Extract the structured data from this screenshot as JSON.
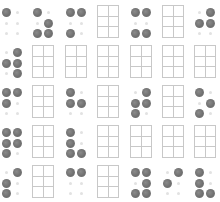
{
  "board": {
    "dot_color": "#777777",
    "grid_color": "#c8c8c8",
    "columns_x": [
      0,
      31,
      64,
      96,
      129,
      161,
      193
    ],
    "rows_y": [
      5,
      45,
      85,
      125,
      165
    ],
    "rows": [
      [
        {
          "type": "braille",
          "dots": [
            1,
            0,
            0,
            0,
            0,
            0
          ]
        },
        {
          "type": "braille",
          "dots": [
            1,
            0,
            0,
            1,
            1,
            1
          ]
        },
        {
          "type": "braille",
          "dots": [
            1,
            1,
            0,
            0,
            1,
            0
          ]
        },
        {
          "type": "grid"
        },
        {
          "type": "braille",
          "dots": [
            1,
            1,
            0,
            0,
            1,
            1
          ]
        },
        {
          "type": "grid"
        },
        {
          "type": "braille",
          "dots": [
            0,
            1,
            1,
            1,
            0,
            0
          ]
        }
      ],
      [
        {
          "type": "braille",
          "dots": [
            0,
            1,
            1,
            1,
            0,
            1
          ]
        },
        {
          "type": "grid"
        },
        {
          "type": "grid"
        },
        {
          "type": "grid"
        },
        {
          "type": "grid"
        },
        {
          "type": "grid"
        },
        {
          "type": "grid"
        }
      ],
      [
        {
          "type": "braille",
          "dots": [
            1,
            1,
            1,
            0,
            0,
            0
          ]
        },
        {
          "type": "grid"
        },
        {
          "type": "braille",
          "dots": [
            1,
            0,
            1,
            1,
            0,
            0
          ]
        },
        {
          "type": "grid"
        },
        {
          "type": "braille",
          "dots": [
            0,
            1,
            1,
            1,
            1,
            0
          ]
        },
        {
          "type": "grid"
        },
        {
          "type": "braille",
          "dots": [
            1,
            0,
            0,
            1,
            1,
            0
          ]
        }
      ],
      [
        {
          "type": "braille",
          "dots": [
            1,
            1,
            1,
            1,
            1,
            0
          ]
        },
        {
          "type": "grid"
        },
        {
          "type": "braille",
          "dots": [
            1,
            0,
            1,
            0,
            1,
            1
          ]
        },
        {
          "type": "grid"
        },
        {
          "type": "grid"
        },
        {
          "type": "grid"
        },
        {
          "type": "grid"
        }
      ],
      [
        {
          "type": "braille",
          "dots": [
            0,
            1,
            1,
            0,
            1,
            0
          ]
        },
        {
          "type": "grid"
        },
        {
          "type": "braille",
          "dots": [
            1,
            1,
            0,
            0,
            0,
            0
          ]
        },
        {
          "type": "grid"
        },
        {
          "type": "braille",
          "dots": [
            1,
            1,
            0,
            1,
            1,
            1
          ]
        },
        {
          "type": "braille",
          "dots": [
            0,
            1,
            1,
            0,
            0,
            0
          ]
        },
        {
          "type": "braille",
          "dots": [
            1,
            0,
            1,
            0,
            1,
            1
          ]
        }
      ]
    ]
  }
}
